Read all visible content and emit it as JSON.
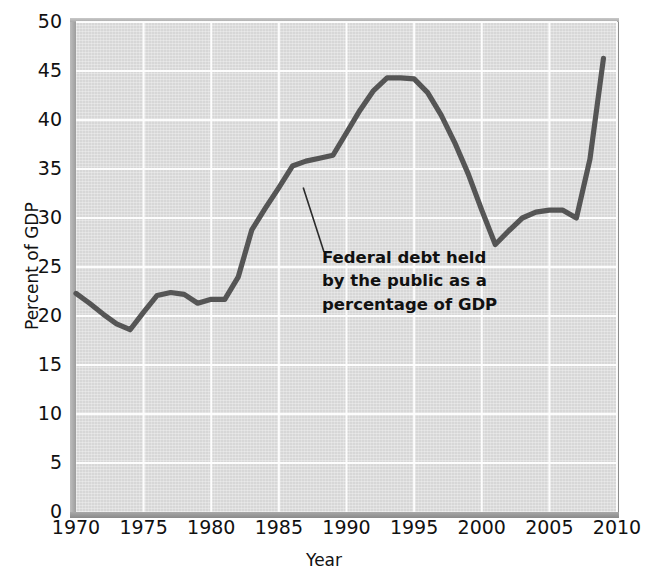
{
  "figure": {
    "title_remnant": "",
    "background_color": "#d7d7d7",
    "line_color": "#555555",
    "text_color": "#111111"
  },
  "annotation": {
    "line1": "Federal debt held",
    "line2": "by the public as a",
    "line3": "percentage of GDP"
  },
  "axes": {
    "ylabel": "Percent of GDP",
    "xlabel": "Year",
    "yticks": [
      "50",
      "45",
      "40",
      "35",
      "30",
      "25",
      "20",
      "15",
      "10",
      "5",
      "0"
    ],
    "xticks": [
      "1970",
      "1975",
      "1980",
      "1985",
      "1990",
      "1995",
      "2000",
      "2005",
      "2010"
    ]
  },
  "chart_data": {
    "type": "line",
    "title": "Federal debt held by the public as a percentage of GDP",
    "xlabel": "Year",
    "ylabel": "Percent of GDP",
    "xlim": [
      1970,
      2010
    ],
    "ylim": [
      0,
      50
    ],
    "ytick_step": 5,
    "xtick_step": 5,
    "grid": true,
    "legend": "none",
    "annotations": [
      {
        "text": "Federal debt held by the public as a percentage of GDP",
        "points_to_year": 1986.8,
        "points_to_value": 33.1
      }
    ],
    "series": [
      {
        "name": "Federal debt held by the public as a percentage of GDP",
        "color": "#555555",
        "x": [
          1970,
          1971,
          1972,
          1973,
          1974,
          1975,
          1976,
          1977,
          1978,
          1979,
          1980,
          1981,
          1982,
          1983,
          1984,
          1985,
          1986,
          1987,
          1988,
          1989,
          1990,
          1991,
          1992,
          1993,
          1994,
          1995,
          1996,
          1997,
          1998,
          1999,
          2000,
          2001,
          2002,
          2003,
          2004,
          2005,
          2006,
          2007,
          2008,
          2009
        ],
        "y": [
          22.3,
          21.3,
          20.2,
          19.2,
          18.6,
          20.4,
          22.1,
          22.4,
          22.2,
          21.3,
          21.7,
          21.7,
          24.0,
          28.8,
          31.0,
          33.1,
          35.3,
          35.8,
          36.1,
          36.4,
          38.7,
          41.0,
          43.0,
          44.3,
          44.3,
          44.2,
          42.8,
          40.5,
          37.7,
          34.5,
          30.8,
          27.3,
          28.7,
          30.0,
          30.6,
          30.8,
          30.8,
          30.0,
          36.0,
          46.3
        ]
      }
    ]
  }
}
